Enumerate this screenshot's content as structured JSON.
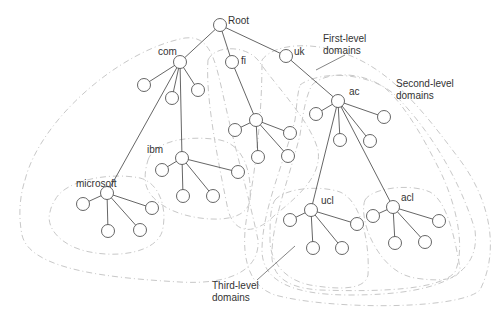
{
  "diagram": {
    "type": "tree",
    "nodes": {
      "root": {
        "label": "Root"
      },
      "com": {
        "label": "com"
      },
      "fi": {
        "label": "fi"
      },
      "uk": {
        "label": "uk"
      },
      "ibm": {
        "label": "ibm"
      },
      "microsoft": {
        "label": "microsoft"
      },
      "ac": {
        "label": "ac"
      },
      "ucl": {
        "label": "ucl"
      },
      "acl": {
        "label": "acl"
      }
    },
    "regions": {
      "first_level": {
        "label_line1": "First-level",
        "label_line2": "domains"
      },
      "second_level": {
        "label_line1": "Second-level",
        "label_line2": "domains"
      },
      "third_level": {
        "label_line1": "Third-level",
        "label_line2": "domains"
      }
    },
    "edges": [
      [
        "root",
        "com"
      ],
      [
        "root",
        "fi"
      ],
      [
        "root",
        "uk"
      ],
      [
        "com",
        "com-c1"
      ],
      [
        "com",
        "com-c2"
      ],
      [
        "com",
        "com-c3"
      ],
      [
        "com",
        "ibm"
      ],
      [
        "com",
        "microsoft"
      ],
      [
        "ibm",
        "ibm-c1"
      ],
      [
        "ibm",
        "ibm-c2"
      ],
      [
        "ibm",
        "ibm-c3"
      ],
      [
        "ibm",
        "ibm-c4"
      ],
      [
        "microsoft",
        "ms-c1"
      ],
      [
        "microsoft",
        "ms-c2"
      ],
      [
        "microsoft",
        "ms-c3"
      ],
      [
        "microsoft",
        "ms-c4"
      ],
      [
        "fi",
        "fi-child"
      ],
      [
        "fi-child",
        "fi-c1"
      ],
      [
        "fi-child",
        "fi-c2"
      ],
      [
        "fi-child",
        "fi-c3"
      ],
      [
        "fi-child",
        "fi-c4"
      ],
      [
        "uk",
        "ac"
      ],
      [
        "ac",
        "ac-c1"
      ],
      [
        "ac",
        "ac-c2"
      ],
      [
        "ac",
        "ac-c3"
      ],
      [
        "ac",
        "ac-c4"
      ],
      [
        "ac",
        "ucl"
      ],
      [
        "ac",
        "acl"
      ],
      [
        "ucl",
        "ucl-c1"
      ],
      [
        "ucl",
        "ucl-c2"
      ],
      [
        "ucl",
        "ucl-c3"
      ],
      [
        "ucl",
        "ucl-c4"
      ],
      [
        "acl",
        "acl-c1"
      ],
      [
        "acl",
        "acl-c2"
      ],
      [
        "acl",
        "acl-c3"
      ],
      [
        "acl",
        "acl-c4"
      ]
    ]
  }
}
